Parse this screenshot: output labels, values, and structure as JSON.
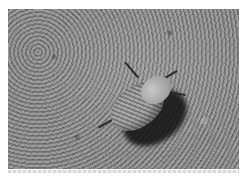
{
  "image": {
    "subject": "beetle on sandy ground",
    "style": "grayscale photograph",
    "colors": {
      "ground": "#8a8a8a",
      "shadow": "#1a1a1a",
      "beetle": "#a0a0a0",
      "border": "#ffffff"
    }
  }
}
